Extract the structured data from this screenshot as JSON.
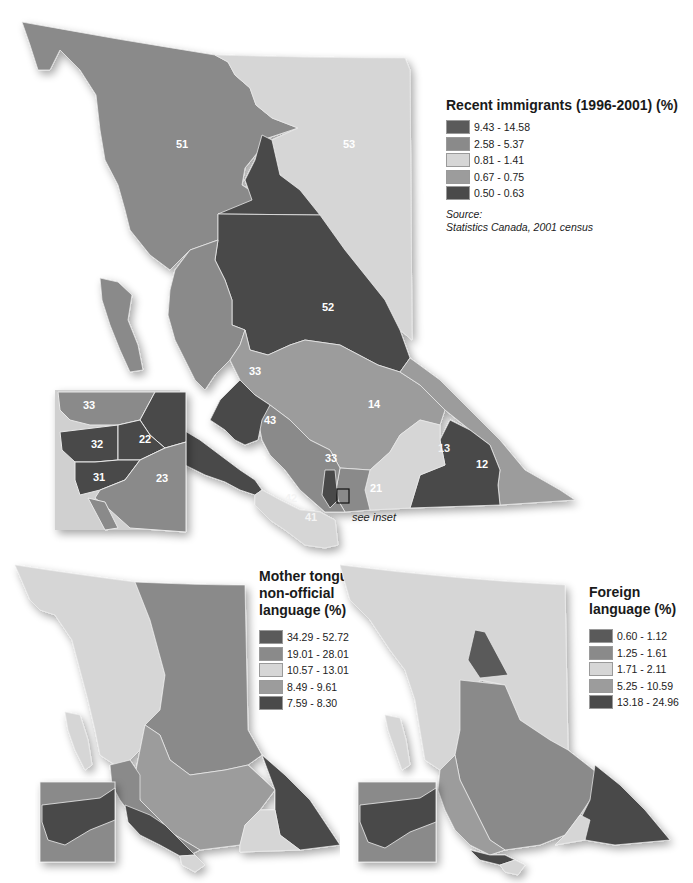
{
  "maps": {
    "main": {
      "legend": {
        "title": "Recent immigrants (1996-2001) (%)",
        "classes": [
          {
            "label": "9.43 - 14.58",
            "color": "#5a5a5a"
          },
          {
            "label": "2.58 - 5.37",
            "color": "#8a8a8a"
          },
          {
            "label": "0.81 - 1.41",
            "color": "#d6d6d6"
          },
          {
            "label": "0.67 - 0.75",
            "color": "#9c9c9c"
          },
          {
            "label": "0.50 - 0.63",
            "color": "#4a4a4a"
          }
        ],
        "source_label": "Source:",
        "source_text": "Statistics Canada, 2001 census"
      },
      "region_labels": {
        "r51": "51",
        "r53": "53",
        "r52": "52",
        "r33": "33",
        "r14": "14",
        "r43a": "43",
        "r43b": "43",
        "r33b": "33",
        "r13": "13",
        "r12": "12",
        "r11": "11",
        "r21": "21",
        "r42": "42",
        "r41": "41"
      },
      "inset_labels": {
        "i33": "33",
        "i32": "32",
        "i22": "22",
        "i31": "31",
        "i23": "23"
      },
      "see_inset": "see inset"
    },
    "mother_tongue": {
      "legend": {
        "title_lines": [
          "Mother tongue",
          "non-official",
          "language (%)"
        ],
        "classes": [
          {
            "label": "34.29 - 52.72",
            "color": "#5a5a5a"
          },
          {
            "label": "19.01 - 28.01",
            "color": "#8a8a8a"
          },
          {
            "label": "10.57 - 13.01",
            "color": "#d6d6d6"
          },
          {
            "label": "8.49 - 9.61",
            "color": "#9c9c9c"
          },
          {
            "label": "7.59 - 8.30",
            "color": "#4a4a4a"
          }
        ]
      }
    },
    "foreign_language": {
      "legend": {
        "title_lines": [
          "Foreign",
          "language (%)"
        ],
        "classes": [
          {
            "label": "0.60 - 1.12",
            "color": "#5a5a5a"
          },
          {
            "label": "1.25 - 1.61",
            "color": "#8a8a8a"
          },
          {
            "label": "1.71 - 2.11",
            "color": "#d6d6d6"
          },
          {
            "label": "5.25 - 10.59",
            "color": "#9c9c9c"
          },
          {
            "label": "13.18 - 24.96",
            "color": "#4a4a4a"
          }
        ]
      }
    }
  }
}
